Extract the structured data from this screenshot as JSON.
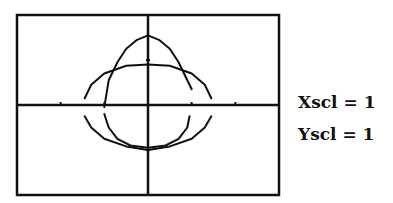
{
  "chart_data": {
    "type": "line",
    "title": "",
    "xlabel": "",
    "ylabel": "",
    "window": {
      "xmin": -3,
      "xmax": 3,
      "ymin": -2,
      "ymax": 2
    },
    "xlim": [
      -3,
      3
    ],
    "ylim": [
      -2,
      2
    ],
    "grid": false,
    "axes": true,
    "tick_marks": {
      "x": [
        -3,
        -2,
        -1,
        1,
        2,
        3
      ],
      "y": [
        -1,
        1
      ]
    },
    "scales": {
      "Xscl": 1,
      "Yscl": 1
    },
    "series": [
      {
        "name": "tall ellipse",
        "description": "narrow ellipse, x-radius ~1.0, top ~1.55, bottom ~-0.95",
        "upper": [
          [
            -1.0,
            -0.05
          ],
          [
            -0.9,
            0.55
          ],
          [
            -0.7,
            0.95
          ],
          [
            -0.5,
            1.25
          ],
          [
            -0.25,
            1.45
          ],
          [
            0,
            1.55
          ],
          [
            0.25,
            1.45
          ],
          [
            0.5,
            1.25
          ],
          [
            0.7,
            0.95
          ],
          [
            0.9,
            0.55
          ],
          [
            1.0,
            0.35
          ]
        ],
        "lower": [
          [
            -1.0,
            -0.2
          ],
          [
            -0.9,
            -0.5
          ],
          [
            -0.7,
            -0.75
          ],
          [
            -0.4,
            -0.9
          ],
          [
            0,
            -0.95
          ],
          [
            0.4,
            -0.9
          ],
          [
            0.7,
            -0.75
          ],
          [
            0.9,
            -0.5
          ],
          [
            0.95,
            -0.25
          ]
        ]
      },
      {
        "name": "wide ellipse",
        "description": "wide ellipse, x-radius ~1.45, top ~0.9, bottom ~-1.0",
        "upper": [
          [
            -1.45,
            0.15
          ],
          [
            -1.3,
            0.45
          ],
          [
            -1.0,
            0.7
          ],
          [
            -0.5,
            0.87
          ],
          [
            0,
            0.9
          ],
          [
            0.5,
            0.87
          ],
          [
            1.0,
            0.7
          ],
          [
            1.3,
            0.45
          ],
          [
            1.45,
            0.15
          ]
        ],
        "lower": [
          [
            -1.45,
            -0.25
          ],
          [
            -1.3,
            -0.5
          ],
          [
            -1.0,
            -0.75
          ],
          [
            -0.5,
            -0.92
          ],
          [
            0,
            -1.0
          ],
          [
            0.5,
            -0.92
          ],
          [
            1.0,
            -0.75
          ],
          [
            1.3,
            -0.5
          ],
          [
            1.45,
            -0.25
          ]
        ]
      }
    ]
  },
  "labels": {
    "xscl": "Xscl = 1",
    "yscl": "Yscl = 1"
  }
}
